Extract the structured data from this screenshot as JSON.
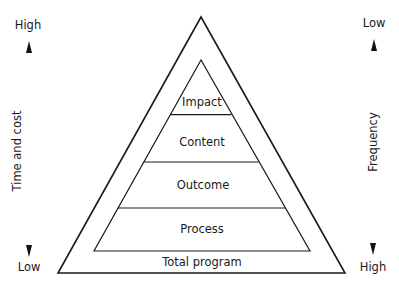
{
  "left_axis": {
    "label": "Time and cost",
    "top": "High",
    "bottom": "Low"
  },
  "right_axis": {
    "label": "Frequency",
    "top": "Low",
    "bottom": "High"
  },
  "pyramid": {
    "levels": [
      {
        "label": "Impact"
      },
      {
        "label": "Content"
      },
      {
        "label": "Outcome"
      },
      {
        "label": "Process"
      }
    ],
    "base_label": "Total program"
  },
  "colors": {
    "line": "#1a1a1a",
    "background": "#ffffff"
  }
}
